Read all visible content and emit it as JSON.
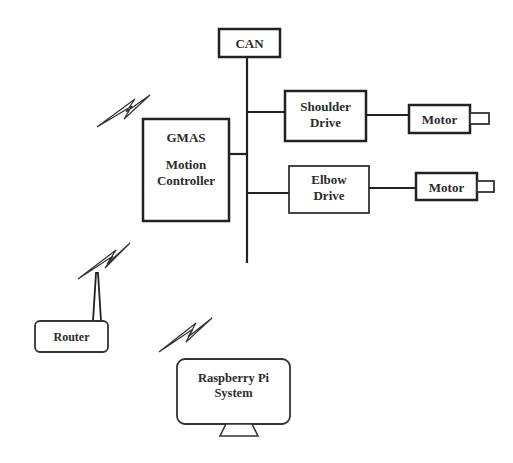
{
  "diagram": {
    "type": "system block diagram",
    "bus": {
      "label": "CAN"
    },
    "controller": {
      "line1": "GMAS",
      "line2": "Motion",
      "line3": "Controller"
    },
    "drives": [
      {
        "line1": "Shoulder",
        "line2": "Drive",
        "motor": "Motor"
      },
      {
        "line1": "Elbow",
        "line2": "Drive",
        "motor": "Motor"
      }
    ],
    "router": {
      "label": "Router"
    },
    "host": {
      "line1": "Raspberry Pi",
      "line2": "System"
    },
    "wireless_links": 3,
    "colors": {
      "stroke": "#222222",
      "text": "#2b2b2b",
      "background": "#ffffff"
    }
  }
}
